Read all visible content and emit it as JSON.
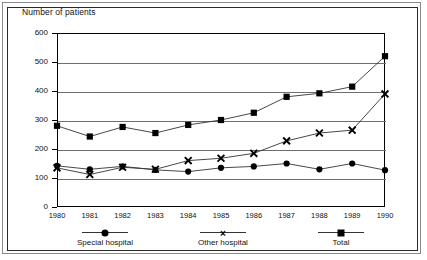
{
  "chart_data": {
    "type": "line",
    "title": "Number of patients",
    "xlabel": "",
    "ylabel": "",
    "ylim": [
      0,
      600
    ],
    "ytick_step": 100,
    "yticks": [
      0,
      100,
      200,
      300,
      400,
      500,
      600
    ],
    "grid": true,
    "legend_position": "bottom",
    "categories": [
      "1980",
      "1981",
      "1982",
      "1983",
      "1984",
      "1985",
      "1986",
      "1987",
      "1988",
      "1989",
      "1990"
    ],
    "series": [
      {
        "name": "Special hospital",
        "marker": "circle",
        "values": [
          142,
          130,
          140,
          128,
          122,
          135,
          140,
          150,
          130,
          150,
          127
        ]
      },
      {
        "name": "Other hospital",
        "marker": "x",
        "values": [
          135,
          112,
          137,
          130,
          160,
          168,
          185,
          228,
          255,
          265,
          390
        ]
      },
      {
        "name": "Total",
        "marker": "square",
        "values": [
          280,
          243,
          276,
          255,
          283,
          300,
          325,
          380,
          392,
          415,
          520
        ]
      }
    ]
  },
  "colors": {
    "line": "#333333",
    "marker": "#000000",
    "grid": "#6e6e6e",
    "axis": "#000000",
    "text": "#111111",
    "frame_outer": "#8a8a8a",
    "frame_inner": "#2a2a2a",
    "background": "#ffffff"
  }
}
